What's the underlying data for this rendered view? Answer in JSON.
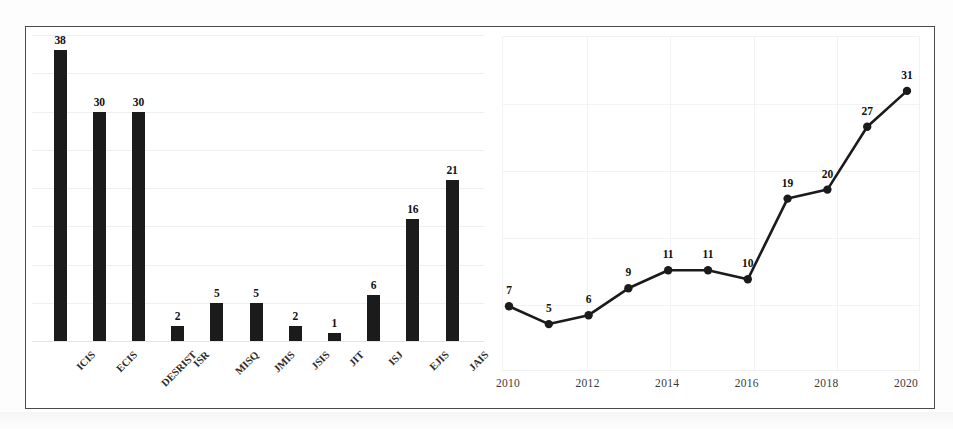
{
  "figure": {
    "frame_color": "#4a4a4a",
    "background": "#ffffff",
    "series_color": "#1b1b1b"
  },
  "chart_data": [
    {
      "type": "bar",
      "title": "",
      "xlabel": "",
      "ylabel": "",
      "categories": [
        "ICIS",
        "ECIS",
        "DESRIST",
        "ISR",
        "MISQ",
        "JMIS",
        "JSIS",
        "JIT",
        "ISJ",
        "EJIS",
        "JAIS"
      ],
      "values": [
        38,
        30,
        30,
        2,
        5,
        5,
        2,
        1,
        6,
        16,
        21
      ],
      "ylim": [
        0,
        40
      ],
      "grid": true,
      "grid_interval": 5,
      "bar_color": "#1b1b1b",
      "data_labels": true,
      "legend": "none"
    },
    {
      "type": "line",
      "title": "",
      "xlabel": "",
      "ylabel": "",
      "x": [
        2010,
        2011,
        2012,
        2013,
        2014,
        2015,
        2016,
        2017,
        2018,
        2019,
        2020
      ],
      "values": [
        7,
        5,
        6,
        9,
        11,
        11,
        10,
        19,
        20,
        27,
        31
      ],
      "tick_labels": [
        "2010",
        "2012",
        "2014",
        "2016",
        "2018",
        "2020"
      ],
      "ylim": [
        0,
        34
      ],
      "grid": true,
      "line_color": "#1b1b1b",
      "marker": "circle",
      "data_labels": true,
      "legend": "none"
    }
  ]
}
